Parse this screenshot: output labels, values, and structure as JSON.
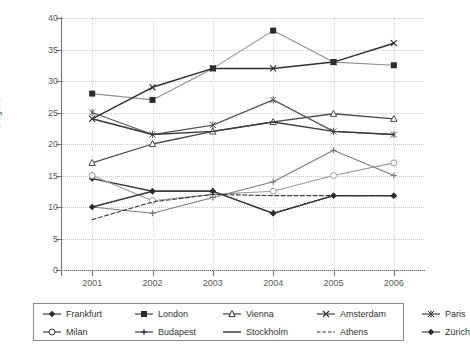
{
  "chart_data": {
    "type": "line",
    "title": "",
    "xlabel": "",
    "ylabel": "Degree",
    "categories": [
      "2001",
      "2002",
      "2003",
      "2004",
      "2005",
      "2006"
    ],
    "ylim": [
      0,
      40
    ],
    "ytick_values": [
      0,
      5,
      10,
      15,
      20,
      25,
      30,
      35,
      40
    ],
    "grid": true,
    "legend_position": "bottom",
    "series": [
      {
        "name": "Frankfurt",
        "marker": "small-filled-diamond",
        "values": [
          14.5,
          12.5,
          12.5,
          9.0,
          11.8,
          11.8
        ]
      },
      {
        "name": "London",
        "marker": "filled-square",
        "values": [
          28.0,
          27.0,
          32.0,
          38.0,
          33.0,
          32.5
        ]
      },
      {
        "name": "Vienna",
        "marker": "open-triangle",
        "values": [
          17.0,
          20.0,
          22.0,
          23.5,
          24.8,
          24.0
        ]
      },
      {
        "name": "Amsterdam",
        "marker": "x-cross",
        "values": [
          24.0,
          29.0,
          32.0,
          32.0,
          33.0,
          36.0
        ]
      },
      {
        "name": "Paris",
        "marker": "asterisk",
        "values": [
          25.0,
          21.5,
          23.0,
          27.0,
          22.0,
          21.5
        ]
      },
      {
        "name": "Milan",
        "marker": "open-circle",
        "values": [
          15.0,
          11.0,
          12.0,
          12.5,
          15.0,
          17.0
        ]
      },
      {
        "name": "Budapest",
        "marker": "plus",
        "values": [
          10.0,
          9.0,
          11.5,
          14.0,
          19.0,
          15.0
        ]
      },
      {
        "name": "Stockholm",
        "marker": "none",
        "values": [
          24.0,
          21.5,
          22.0,
          23.5,
          22.0,
          21.5
        ]
      },
      {
        "name": "Athens",
        "marker": "dashed-line",
        "values": [
          8.0,
          10.8,
          12.0,
          11.8,
          11.8,
          11.8
        ]
      },
      {
        "name": "Zürich",
        "marker": "filled-diamond",
        "values": [
          10.0,
          12.5,
          12.5,
          9.0,
          11.8,
          11.8
        ]
      }
    ]
  },
  "legend": {
    "items": [
      {
        "label": "Frankfurt",
        "symbol": "small-filled-diamond"
      },
      {
        "label": "London",
        "symbol": "filled-square"
      },
      {
        "label": "Vienna",
        "symbol": "open-triangle"
      },
      {
        "label": "Amsterdam",
        "symbol": "x-cross"
      },
      {
        "label": "Paris",
        "symbol": "asterisk"
      },
      {
        "label": "Milan",
        "symbol": "open-circle"
      },
      {
        "label": "Budapest",
        "symbol": "plus"
      },
      {
        "label": "Stockholm",
        "symbol": "none"
      },
      {
        "label": "Athens",
        "symbol": "dashed-line"
      },
      {
        "label": "Zürich",
        "symbol": "filled-diamond"
      }
    ]
  },
  "colors": {
    "line_dark": "#3a3a3a",
    "line_mid": "#707070",
    "line_light": "#9a9a9a",
    "axis": "#6f6f6f",
    "grid": "#c9c9c9",
    "text": "#5a5a5a",
    "background": "#ffffff"
  }
}
